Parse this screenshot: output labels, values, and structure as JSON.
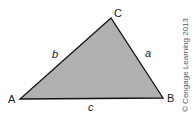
{
  "diagram": {
    "type": "triangle",
    "fill_color": "#b0b0b0",
    "stroke_color": "#111111",
    "vertices": {
      "A": {
        "label": "A",
        "x": 20,
        "y": 99
      },
      "B": {
        "label": "B",
        "x": 163,
        "y": 98
      },
      "C": {
        "label": "C",
        "x": 111,
        "y": 18
      }
    },
    "sides": {
      "a": {
        "label": "a",
        "between": "B-C"
      },
      "b": {
        "label": "b",
        "between": "A-C"
      },
      "c": {
        "label": "c",
        "between": "A-B"
      }
    },
    "copyright": "© Cengage Learning 2013"
  }
}
